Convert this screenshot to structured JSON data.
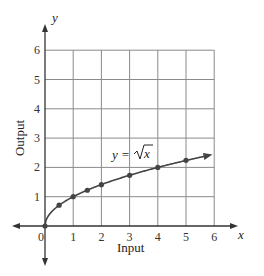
{
  "chart_data": {
    "type": "line",
    "title": "",
    "xlabel": "Input",
    "ylabel": "Output",
    "x_axis_var": "x",
    "y_axis_var": "y",
    "xlim": [
      0,
      6
    ],
    "ylim": [
      0,
      6
    ],
    "x_ticks": [
      "0",
      "1",
      "2",
      "3",
      "4",
      "5",
      "6"
    ],
    "y_ticks": [
      "1",
      "2",
      "3",
      "4",
      "5",
      "6"
    ],
    "grid": true,
    "annotation": "y = √x",
    "series": [
      {
        "name": "y = √x",
        "points": [
          {
            "x": 0,
            "y": 0
          },
          {
            "x": 0.5,
            "y": 0.71
          },
          {
            "x": 1,
            "y": 1
          },
          {
            "x": 1.5,
            "y": 1.22
          },
          {
            "x": 2,
            "y": 1.41
          },
          {
            "x": 3,
            "y": 1.73
          },
          {
            "x": 4,
            "y": 2
          },
          {
            "x": 5,
            "y": 2.24
          }
        ],
        "continues_with_arrow": true
      }
    ]
  },
  "labels": {
    "xlabel": "Input",
    "ylabel": "Output",
    "x_var": "x",
    "y_var": "y",
    "eq_prefix": "y = ",
    "eq_radicand": "x",
    "origin": "0"
  },
  "colors": {
    "grid": "#8a8a8a",
    "axis": "#333333",
    "curve": "#444444"
  }
}
